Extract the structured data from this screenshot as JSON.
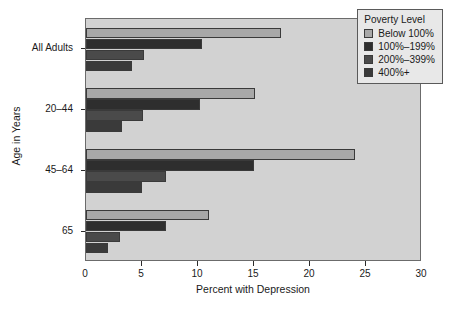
{
  "chart_data": {
    "type": "bar",
    "orientation": "horizontal",
    "title": "",
    "xlabel": "Percent with Depression",
    "ylabel": "Age in Years",
    "xlim": [
      0,
      30
    ],
    "xticks": [
      0,
      5,
      10,
      15,
      20,
      25,
      30
    ],
    "xtick_labels": [
      "0",
      "5",
      "10",
      "15",
      "20",
      "25",
      "30"
    ],
    "categories": [
      "All Adults",
      "20–44",
      "45–64",
      "65"
    ],
    "grid": false,
    "legend_position": "top-right",
    "legend_title": "Poverty Level",
    "series": [
      {
        "name": "Below 100%",
        "color": "#a8a8a8",
        "values": [
          17.4,
          15.1,
          24.0,
          11.0
        ]
      },
      {
        "name": "100%–199%",
        "color": "#2e2e2e",
        "values": [
          10.4,
          10.2,
          15.0,
          7.1
        ]
      },
      {
        "name": "200%–399%",
        "color": "#4a4a4a",
        "values": [
          5.2,
          5.1,
          7.1,
          3.0
        ]
      },
      {
        "name": "400%+",
        "color": "#3a3a3a",
        "values": [
          4.1,
          3.2,
          5.0,
          2.0
        ]
      }
    ]
  },
  "legend": {
    "title": "Poverty Level",
    "items": [
      {
        "label": "Below 100%"
      },
      {
        "label": "100%–199%"
      },
      {
        "label": "200%–399%"
      },
      {
        "label": "400%+"
      }
    ]
  },
  "axes": {
    "x_title": "Percent with Depression",
    "y_title": "Age in Years",
    "x_labels": [
      "0",
      "5",
      "10",
      "15",
      "20",
      "25",
      "30"
    ],
    "y_labels": [
      "All Adults",
      "20–44",
      "45–64",
      "65"
    ]
  },
  "colors": {
    "plot_background": "#d2d2d2",
    "frame": "#6b6b6b",
    "page_background": "#ffffff",
    "legend_background": "#e8e8e8"
  }
}
